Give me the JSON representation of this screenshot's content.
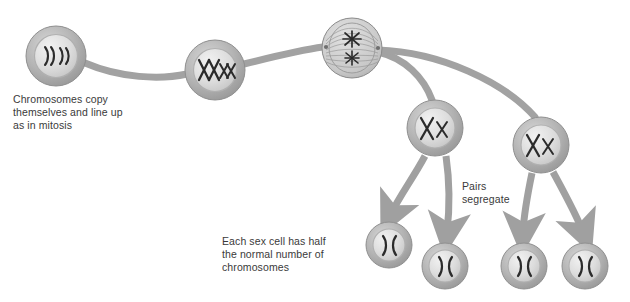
{
  "diagram": {
    "palette": {
      "cell_outer": "#b2b2b2",
      "cell_outer_dark": "#9a9a9a",
      "cell_inner": "#d9d9d9",
      "cell_inner_light": "#ececec",
      "chromosome": "#2b2b2b",
      "connector": "#a0a0a0",
      "arrow": "#a0a0a0",
      "text": "#3a3a3a",
      "background": "#ffffff"
    },
    "captions": [
      {
        "id": "caption-copy",
        "text": "Chromosomes copy\nthemselves and line up\nas in mitosis"
      },
      {
        "id": "caption-half",
        "text": "Each sex cell has half\nthe normal number of\nchromosomes"
      },
      {
        "id": "caption-pairs",
        "text": "Pairs\nsegregate"
      }
    ],
    "cells": [
      {
        "id": "cell-parent",
        "stage": "parent-cell",
        "label": "Parent cell with unreplicated chromosomes",
        "cx": 56,
        "cy": 56,
        "r": 30,
        "content": "four-curved-chromosomes",
        "glyph": ")) ))"
      },
      {
        "id": "cell-replicated",
        "stage": "replicated-chromosomes",
        "label": "Chromosomes replicated and paired",
        "cx": 215,
        "cy": 70,
        "r": 30,
        "content": "x-chromosomes-paired",
        "glyph": "XXxx"
      },
      {
        "id": "cell-spindle",
        "stage": "metaphase-spindle",
        "label": "Spindle forms, pairs align",
        "cx": 352,
        "cy": 48,
        "r": 30,
        "content": "spindle-with-two-chromosome-clusters",
        "glyph": "✳ ✳"
      },
      {
        "id": "cell-daughter-left",
        "stage": "first-division-daughter",
        "label": "Daughter cell after first division",
        "cx": 435,
        "cy": 128,
        "r": 28,
        "content": "one-large-one-small-x",
        "glyph": "X x"
      },
      {
        "id": "cell-daughter-right",
        "stage": "first-division-daughter",
        "label": "Daughter cell after first division",
        "cx": 541,
        "cy": 145,
        "r": 28,
        "content": "one-large-one-small-x",
        "glyph": "X x"
      },
      {
        "id": "cell-gamete-1",
        "stage": "gamete",
        "label": "Sex cell",
        "cx": 389,
        "cy": 245,
        "r": 23,
        "content": "two-curved-chromatids",
        "glyph": ")("
      },
      {
        "id": "cell-gamete-2",
        "stage": "gamete",
        "label": "Sex cell",
        "cx": 445,
        "cy": 266,
        "r": 23,
        "content": "two-curved-chromatids",
        "glyph": ")("
      },
      {
        "id": "cell-gamete-3",
        "stage": "gamete",
        "label": "Sex cell",
        "cx": 524,
        "cy": 266,
        "r": 23,
        "content": "two-curved-chromatids",
        "glyph": ")("
      },
      {
        "id": "cell-gamete-4",
        "stage": "gamete",
        "label": "Sex cell",
        "cx": 585,
        "cy": 266,
        "r": 23,
        "content": "two-curved-chromatids",
        "glyph": ")("
      }
    ],
    "connectors": [
      {
        "id": "connector-parent-to-replicated",
        "from": "cell-parent",
        "to": "cell-replicated",
        "kind": "band"
      },
      {
        "id": "connector-replicated-to-spindle",
        "from": "cell-replicated",
        "to": "cell-spindle",
        "kind": "band"
      },
      {
        "id": "connector-spindle-to-daughter-left",
        "from": "cell-spindle",
        "to": "cell-daughter-left",
        "kind": "band"
      },
      {
        "id": "connector-spindle-to-daughter-right",
        "from": "cell-spindle",
        "to": "cell-daughter-right",
        "kind": "band"
      }
    ],
    "arrows": [
      {
        "id": "arrow-daughter-left-to-gamete-1",
        "from": "cell-daughter-left",
        "to": "cell-gamete-1"
      },
      {
        "id": "arrow-daughter-left-to-gamete-2",
        "from": "cell-daughter-left",
        "to": "cell-gamete-2"
      },
      {
        "id": "arrow-daughter-right-to-gamete-3",
        "from": "cell-daughter-right",
        "to": "cell-gamete-3"
      },
      {
        "id": "arrow-daughter-right-to-gamete-4",
        "from": "cell-daughter-right",
        "to": "cell-gamete-4"
      }
    ]
  }
}
